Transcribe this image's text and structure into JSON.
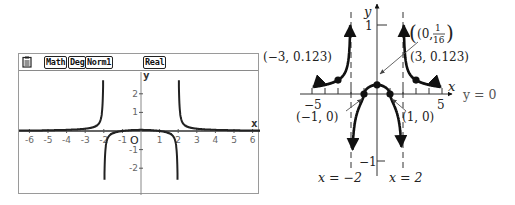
{
  "chart_data": [
    {
      "type": "line",
      "title": "Graphing calculator plot of f(x) = (x^2 - 1)/(x^4 - 16)",
      "status_bar": {
        "icon": "memo-icon",
        "badges": [
          "Math",
          "Deg",
          "Norm1",
          "Real"
        ]
      },
      "xlabel": "x",
      "ylabel": "y",
      "origin_label": "O",
      "xlim": [
        -6.5,
        6.3
      ],
      "ylim": [
        -3,
        3
      ],
      "x_ticks": [
        -6,
        -5,
        -4,
        -3,
        -2,
        -1,
        1,
        2,
        3,
        4,
        5,
        6
      ],
      "y_ticks": [
        2,
        1,
        -1,
        -2
      ],
      "grid": false,
      "vertical_asymptotes": [
        -2,
        2
      ],
      "horizontal_asymptote": 0,
      "series": [
        {
          "name": "f(x)",
          "function": "(x^2-1)/(x^4-16)",
          "color": "#222222"
        }
      ]
    },
    {
      "type": "line",
      "title": "Hand-drawn graph of f(x) with asymptotes and labeled points",
      "xlabel": "x",
      "ylabel": "y",
      "xlim": [
        -5.5,
        5.5
      ],
      "ylim": [
        -1.2,
        1.3
      ],
      "x_ticks": [
        -5,
        -4,
        -3,
        -2,
        -1,
        1,
        2,
        3,
        4,
        5
      ],
      "x_tick_labels": {
        "-5": "−5",
        "5": "5"
      },
      "y_ticks": [
        1,
        -1
      ],
      "y_tick_labels": {
        "1": "1",
        "-1": "−1"
      },
      "grid": false,
      "vertical_asymptotes": [
        {
          "x": -2,
          "label": "x = −2"
        },
        {
          "x": 2,
          "label": "x = 2"
        }
      ],
      "horizontal_asymptote": {
        "y": 0,
        "label": "y = 0"
      },
      "points": [
        {
          "x": -3,
          "y": 0.123,
          "label": "(−3, 0.123)"
        },
        {
          "x": 3,
          "y": 0.123,
          "label": "(3, 0.123)"
        },
        {
          "x": -1,
          "y": 0,
          "label": "(−1, 0)"
        },
        {
          "x": 1,
          "y": 0,
          "label": "(1, 0)"
        },
        {
          "x": 0,
          "y": 0.0625,
          "label": "(0, 1/16)",
          "label_num": "1",
          "label_den": "16",
          "label_prefix": "(0, "
        }
      ],
      "series": [
        {
          "name": "f(x)",
          "function": "(x^2-1)/(x^4-16)",
          "color": "#111111"
        }
      ]
    }
  ],
  "calc": {
    "badges": [
      "Math",
      "Deg",
      "Norm1",
      "Real"
    ],
    "x_label": "x",
    "y_label": "y",
    "origin_label": "O"
  },
  "book": {
    "x_label": "x",
    "y_label": "y",
    "ha_label": "y = 0",
    "va_left_label": "x = −2",
    "va_right_label": "x = 2",
    "tick_neg5": "−5",
    "tick_5": "5",
    "tick_1": "1",
    "tick_neg1": "−1",
    "pt_left_label": "(−3, 0.123)",
    "pt_right_label": "(3, 0.123)",
    "pt_zero_left_label": "(−1, 0)",
    "pt_zero_right_label": "(1, 0)",
    "pt_yint_prefix": "(0, ",
    "pt_yint_num": "1",
    "pt_yint_den": "16",
    "pt_yint_suffix": ")"
  }
}
